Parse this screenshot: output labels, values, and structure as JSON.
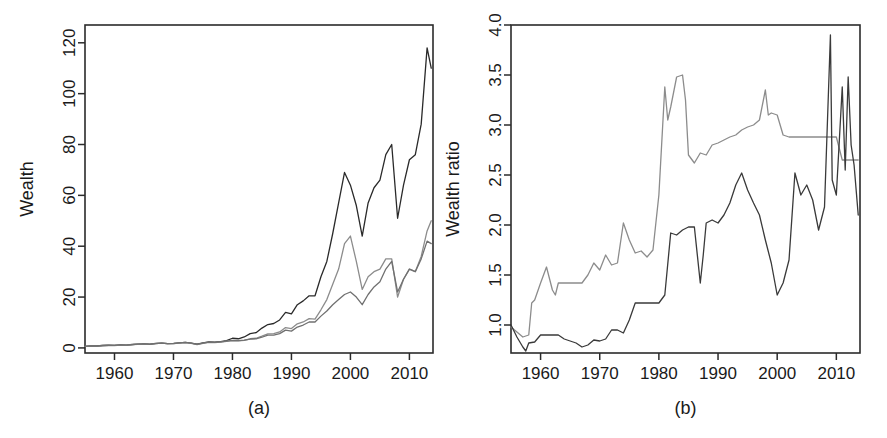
{
  "figure": {
    "background": "#ffffff",
    "width": 887,
    "height": 438
  },
  "panels": [
    {
      "id": "a",
      "caption": "(a)",
      "ylabel": "Wealth",
      "xlabel": ""
    },
    {
      "id": "b",
      "caption": "(b)",
      "ylabel": "Wealth ratio",
      "xlabel": ""
    }
  ],
  "chart_data": [
    {
      "type": "line",
      "panel": "a",
      "title": "",
      "xlabel": "",
      "ylabel": "Wealth",
      "xlim": [
        1955,
        2014
      ],
      "ylim": [
        -2,
        127
      ],
      "xticks": [
        1960,
        1970,
        1980,
        1990,
        2000,
        2010
      ],
      "xticklabels": [
        "1960",
        "1970",
        "1980",
        "1990",
        "2000",
        "2010"
      ],
      "yticks": [
        0,
        20,
        40,
        60,
        80,
        100,
        120
      ],
      "yticklabels": [
        "0",
        "20",
        "40",
        "60",
        "80",
        "100",
        "120"
      ],
      "grid": false,
      "legend": "none",
      "caption": "(a)",
      "series": [
        {
          "name": "black-series",
          "color": "#2a2a2a",
          "width": 1.3,
          "x": [
            1955,
            1956,
            1957,
            1958,
            1959,
            1960,
            1961,
            1962,
            1963,
            1964,
            1965,
            1966,
            1967,
            1968,
            1969,
            1970,
            1971,
            1972,
            1973,
            1974,
            1975,
            1976,
            1977,
            1978,
            1979,
            1980,
            1981,
            1982,
            1983,
            1984,
            1985,
            1986,
            1987,
            1988,
            1989,
            1990,
            1991,
            1992,
            1993,
            1994,
            1995,
            1996,
            1997,
            1998,
            1999,
            2000,
            2001,
            2002,
            2003,
            2004,
            2005,
            2006,
            2007,
            2008,
            2009,
            2010,
            2011,
            2012,
            2013,
            2013.7
          ],
          "y": [
            0.6,
            0.8,
            0.75,
            0.95,
            1.05,
            1.0,
            1.2,
            1.1,
            1.35,
            1.5,
            1.6,
            1.45,
            1.75,
            1.9,
            1.7,
            1.75,
            2.0,
            2.2,
            1.9,
            1.5,
            2.0,
            2.4,
            2.3,
            2.5,
            2.9,
            3.8,
            3.6,
            4.3,
            5.6,
            6.0,
            7.8,
            9.2,
            9.6,
            11.0,
            14.0,
            13.4,
            17.0,
            18.5,
            20.5,
            20.5,
            28.0,
            34.0,
            45.0,
            57.0,
            69.0,
            64.0,
            56.0,
            44.0,
            57.0,
            63.0,
            66.0,
            76.0,
            80.0,
            51.0,
            64.0,
            74.0,
            76.0,
            88.0,
            118.0,
            110.0
          ]
        },
        {
          "name": "gray-series-1",
          "color": "#8c8c8c",
          "width": 1.3,
          "x": [
            1955,
            1956,
            1957,
            1958,
            1959,
            1960,
            1961,
            1962,
            1963,
            1964,
            1965,
            1966,
            1967,
            1968,
            1969,
            1970,
            1971,
            1972,
            1973,
            1974,
            1975,
            1976,
            1977,
            1978,
            1979,
            1980,
            1981,
            1982,
            1983,
            1984,
            1985,
            1986,
            1987,
            1988,
            1989,
            1990,
            1991,
            1992,
            1993,
            1994,
            1995,
            1996,
            1997,
            1998,
            1999,
            2000,
            2001,
            2002,
            2003,
            2004,
            2005,
            2006,
            2007,
            2008,
            2009,
            2010,
            2011,
            2012,
            2013,
            2013.7
          ],
          "y": [
            0.6,
            0.7,
            0.7,
            0.9,
            1.0,
            0.95,
            1.1,
            1.05,
            1.3,
            1.45,
            1.5,
            1.4,
            1.7,
            1.85,
            1.65,
            1.7,
            1.9,
            2.1,
            1.8,
            1.3,
            1.8,
            2.2,
            2.1,
            2.3,
            2.6,
            2.9,
            2.8,
            3.0,
            3.6,
            3.8,
            4.6,
            5.5,
            5.6,
            6.3,
            8.0,
            7.6,
            9.5,
            10.2,
            11.5,
            11.3,
            15.0,
            19.0,
            25.0,
            31.0,
            41.0,
            44.0,
            34.0,
            23.0,
            28.0,
            30.0,
            31.0,
            35.0,
            35.0,
            20.0,
            27.0,
            31.0,
            30.0,
            36.0,
            46.0,
            50.0
          ]
        },
        {
          "name": "gray-series-2",
          "color": "#707070",
          "width": 1.3,
          "x": [
            1955,
            1956,
            1957,
            1958,
            1959,
            1960,
            1961,
            1962,
            1963,
            1964,
            1965,
            1966,
            1967,
            1968,
            1969,
            1970,
            1971,
            1972,
            1973,
            1974,
            1975,
            1976,
            1977,
            1978,
            1979,
            1980,
            1981,
            1982,
            1983,
            1984,
            1985,
            1986,
            1987,
            1988,
            1989,
            1990,
            1991,
            1992,
            1993,
            1994,
            1995,
            1996,
            1997,
            1998,
            1999,
            2000,
            2001,
            2002,
            2003,
            2004,
            2005,
            2006,
            2007,
            2008,
            2009,
            2010,
            2011,
            2012,
            2013,
            2013.7
          ],
          "y": [
            0.62,
            0.78,
            0.76,
            0.94,
            1.02,
            0.98,
            1.16,
            1.08,
            1.32,
            1.48,
            1.55,
            1.42,
            1.72,
            1.88,
            1.68,
            1.72,
            1.95,
            2.15,
            1.85,
            1.4,
            1.9,
            2.3,
            2.2,
            2.4,
            2.7,
            3.0,
            2.9,
            3.1,
            3.5,
            3.6,
            4.2,
            5.0,
            5.0,
            5.6,
            7.0,
            6.6,
            8.2,
            9.0,
            10.2,
            10.2,
            12.5,
            14.5,
            17.0,
            19.0,
            21.0,
            22.0,
            20.0,
            17.0,
            21.0,
            24.0,
            26.0,
            31.0,
            34.0,
            22.0,
            27.0,
            31.0,
            30.0,
            35.0,
            42.0,
            41.0
          ]
        }
      ]
    },
    {
      "type": "line",
      "panel": "b",
      "title": "",
      "xlabel": "",
      "ylabel": "Wealth ratio",
      "xlim": [
        1955,
        2014
      ],
      "ylim": [
        0.72,
        4.0
      ],
      "xticks": [
        1960,
        1970,
        1980,
        1990,
        2000,
        2010
      ],
      "xticklabels": [
        "1960",
        "1970",
        "1980",
        "1990",
        "2000",
        "2010"
      ],
      "yticks": [
        1.0,
        1.5,
        2.0,
        2.5,
        3.0,
        3.5,
        4.0
      ],
      "yticklabels": [
        "1.0",
        "1.5",
        "2.0",
        "2.5",
        "3.0",
        "3.5",
        "4.0"
      ],
      "grid": false,
      "legend": "none",
      "caption": "(b)",
      "series": [
        {
          "name": "gray-series-upper",
          "color": "#8c8c8c",
          "width": 1.3,
          "x": [
            1955,
            1956,
            1957,
            1958,
            1958.5,
            1959,
            1960,
            1961,
            1962,
            1962.5,
            1963,
            1964,
            1965,
            1966,
            1967,
            1968,
            1969,
            1970,
            1971,
            1972,
            1973,
            1974,
            1975,
            1976,
            1977,
            1978,
            1979,
            1980,
            1981,
            1981.5,
            1982,
            1983,
            1984,
            1984.5,
            1985,
            1986,
            1987,
            1988,
            1989,
            1990,
            1991,
            1992,
            1993,
            1994,
            1995,
            1996,
            1997,
            1998,
            1998.5,
            1999,
            2000,
            2001,
            2002,
            2003,
            2004,
            2005,
            2006,
            2007,
            2008,
            2009,
            2010,
            2011,
            2012,
            2013,
            2013.7
          ],
          "y": [
            0.98,
            0.93,
            0.88,
            0.9,
            1.22,
            1.25,
            1.42,
            1.58,
            1.35,
            1.3,
            1.42,
            1.42,
            1.42,
            1.42,
            1.42,
            1.5,
            1.62,
            1.55,
            1.7,
            1.6,
            1.62,
            2.02,
            1.85,
            1.72,
            1.74,
            1.68,
            1.75,
            2.3,
            3.38,
            3.05,
            3.18,
            3.48,
            3.5,
            3.25,
            2.7,
            2.62,
            2.72,
            2.7,
            2.8,
            2.82,
            2.85,
            2.88,
            2.9,
            2.95,
            2.98,
            3.0,
            3.05,
            3.35,
            3.1,
            3.12,
            3.1,
            2.9,
            2.88,
            2.88,
            2.88,
            2.88,
            2.88,
            2.88,
            2.88,
            2.88,
            2.88,
            2.65,
            2.65,
            2.65,
            2.65
          ]
        },
        {
          "name": "black-series-lower",
          "color": "#3a3a3a",
          "width": 1.3,
          "x": [
            1955,
            1956,
            1957,
            1957.5,
            1958,
            1959,
            1960,
            1961,
            1962,
            1963,
            1964,
            1965,
            1966,
            1967,
            1968,
            1969,
            1970,
            1971,
            1972,
            1973,
            1974,
            1975,
            1976,
            1977,
            1978,
            1979,
            1980,
            1981,
            1982,
            1983,
            1984,
            1985,
            1986,
            1987,
            1987.5,
            1988,
            1989,
            1990,
            1991,
            1992,
            1993,
            1994,
            1995,
            1996,
            1997,
            1998,
            1999,
            2000,
            2001,
            2002,
            2003,
            2004,
            2005,
            2006,
            2007,
            2008,
            2009,
            2009.3,
            2010,
            2011,
            2011.5,
            2012,
            2012.5,
            2013,
            2013.7
          ],
          "y": [
            1.0,
            0.88,
            0.78,
            0.74,
            0.82,
            0.83,
            0.9,
            0.9,
            0.9,
            0.9,
            0.86,
            0.84,
            0.82,
            0.78,
            0.8,
            0.85,
            0.84,
            0.86,
            0.95,
            0.95,
            0.92,
            1.05,
            1.22,
            1.22,
            1.22,
            1.22,
            1.22,
            1.3,
            1.92,
            1.9,
            1.95,
            1.98,
            1.98,
            1.42,
            1.7,
            2.02,
            2.05,
            2.02,
            2.1,
            2.22,
            2.4,
            2.52,
            2.35,
            2.22,
            2.1,
            1.85,
            1.62,
            1.3,
            1.42,
            1.65,
            2.52,
            2.3,
            2.4,
            2.25,
            1.95,
            2.18,
            3.9,
            2.45,
            2.3,
            3.38,
            2.55,
            3.48,
            2.8,
            2.6,
            2.1
          ]
        }
      ]
    }
  ]
}
